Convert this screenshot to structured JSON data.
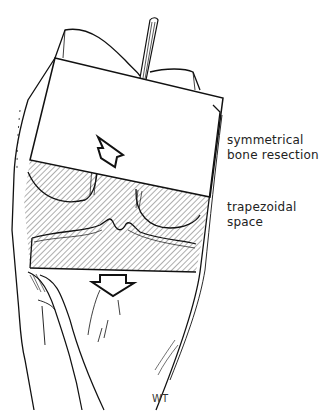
{
  "figure": {
    "labels": {
      "resection_line1": "symmetrical",
      "resection_line2": "bone resection",
      "space_line1": "trapezoidal",
      "space_line2": "space"
    },
    "signature": "WT",
    "colors": {
      "line": "#111111",
      "background": "#ffffff",
      "hatch": "#333333"
    }
  }
}
